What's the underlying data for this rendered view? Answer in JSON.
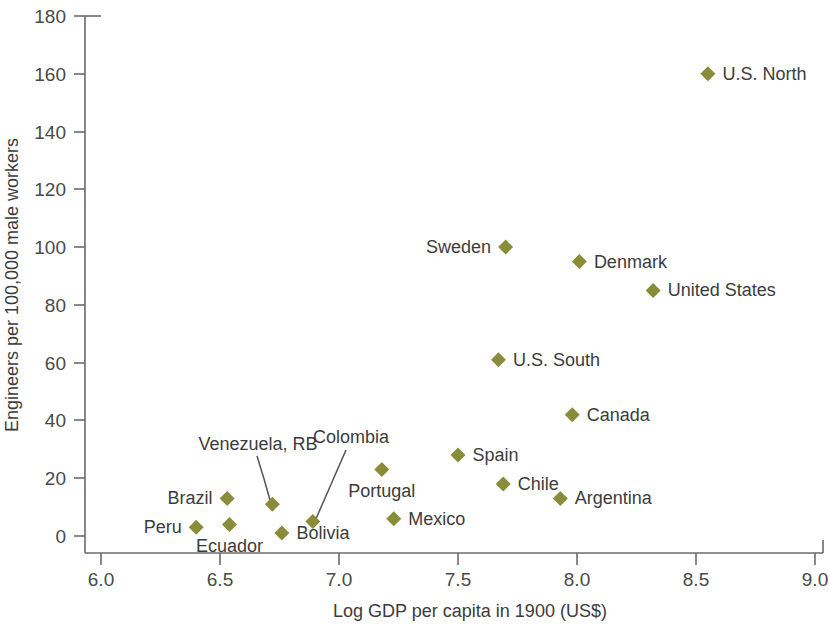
{
  "chart_data": {
    "type": "scatter",
    "title": "",
    "xlabel": "Log GDP per capita in 1900 (US$)",
    "ylabel": "Engineers per 100,000 male workers",
    "xlim": [
      6.0,
      9.0
    ],
    "ylim": [
      0,
      180
    ],
    "xticks": [
      "6.0",
      "6.5",
      "7.0",
      "7.5",
      "8.0",
      "8.5",
      "9.0"
    ],
    "xtick_values": [
      6.0,
      6.5,
      7.0,
      7.5,
      8.0,
      8.5,
      9.0
    ],
    "yticks": [
      "0",
      "20",
      "40",
      "60",
      "80",
      "100",
      "120",
      "140",
      "160",
      "180"
    ],
    "ytick_values": [
      0,
      20,
      40,
      60,
      80,
      100,
      120,
      140,
      160,
      180
    ],
    "grid": false,
    "legend": "none",
    "marker": "diamond",
    "marker_color": "#8b8c3a",
    "points": [
      {
        "label": "U.S. North",
        "x": 8.55,
        "y": 160,
        "label_pos": "right"
      },
      {
        "label": "Sweden",
        "x": 7.7,
        "y": 100,
        "label_pos": "left"
      },
      {
        "label": "Denmark",
        "x": 8.01,
        "y": 95,
        "label_pos": "right"
      },
      {
        "label": "United States",
        "x": 8.32,
        "y": 85,
        "label_pos": "right"
      },
      {
        "label": "U.S. South",
        "x": 7.67,
        "y": 61,
        "label_pos": "right"
      },
      {
        "label": "Canada",
        "x": 7.98,
        "y": 42,
        "label_pos": "right"
      },
      {
        "label": "Spain",
        "x": 7.5,
        "y": 28,
        "label_pos": "right"
      },
      {
        "label": "Portugal",
        "x": 7.18,
        "y": 23,
        "label_pos": "below"
      },
      {
        "label": "Chile",
        "x": 7.69,
        "y": 18,
        "label_pos": "right"
      },
      {
        "label": "Argentina",
        "x": 7.93,
        "y": 13,
        "label_pos": "right"
      },
      {
        "label": "Brazil",
        "x": 6.53,
        "y": 13,
        "label_pos": "left"
      },
      {
        "label": "Venezuela, RB",
        "x": 6.72,
        "y": 11,
        "label_pos": "leader"
      },
      {
        "label": "Mexico",
        "x": 7.23,
        "y": 6,
        "label_pos": "right"
      },
      {
        "label": "Colombia",
        "x": 6.89,
        "y": 5,
        "label_pos": "leader"
      },
      {
        "label": "Ecuador",
        "x": 6.54,
        "y": 4,
        "label_pos": "below"
      },
      {
        "label": "Peru",
        "x": 6.4,
        "y": 3,
        "label_pos": "left"
      },
      {
        "label": "Bolivia",
        "x": 6.76,
        "y": 1,
        "label_pos": "right"
      }
    ],
    "annotations": [
      {
        "label": "Venezuela, RB",
        "note": "leader line from label to marker"
      },
      {
        "label": "Colombia",
        "note": "leader line from label to marker"
      }
    ]
  }
}
